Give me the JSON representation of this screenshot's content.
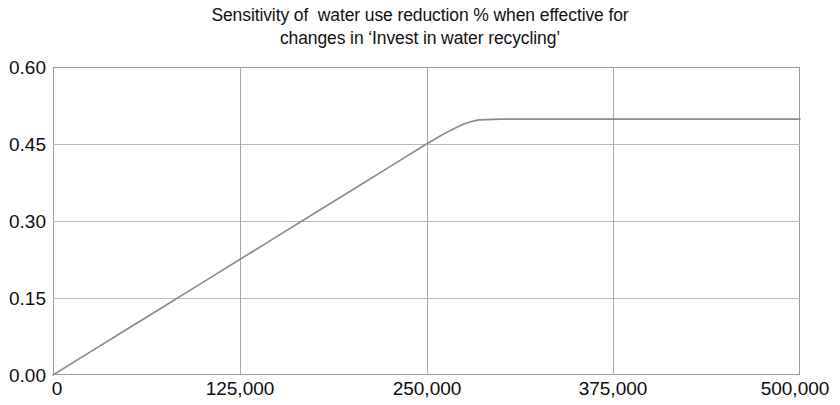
{
  "chart_data": {
    "type": "line",
    "title": "Sensitivity of  water use reduction % when effective for\nchanges in ‘Invest in water recycling’",
    "title_line1": "Sensitivity of  water use reduction % when effective for",
    "title_line2": "changes in ‘Invest in water recycling’",
    "xlabel": "",
    "ylabel": "",
    "xlim": [
      0,
      500000
    ],
    "ylim": [
      0.0,
      0.6
    ],
    "grid": true,
    "legend": "none",
    "line_color": "#8a8a8a",
    "frame_color": "#9a9a9a",
    "grid_color": "#b9b9b9",
    "xticks": [
      0,
      125000,
      250000,
      375000,
      500000
    ],
    "xtick_labels": [
      "0",
      "125,000",
      "250,000",
      "375,000",
      "500,000"
    ],
    "yticks": [
      0.0,
      0.15,
      0.3,
      0.45,
      0.6
    ],
    "ytick_labels": [
      "0.00",
      "0.15",
      "0.30",
      "0.45",
      "0.60"
    ],
    "series": [
      {
        "name": "water use reduction %",
        "x": [
          0,
          25000,
          50000,
          75000,
          100000,
          125000,
          150000,
          175000,
          200000,
          225000,
          250000,
          260000,
          265000,
          270000,
          275000,
          280000,
          285000,
          300000,
          325000,
          350000,
          375000,
          400000,
          425000,
          450000,
          475000,
          500000
        ],
        "values": [
          0.0,
          0.045,
          0.09,
          0.135,
          0.18,
          0.225,
          0.27,
          0.315,
          0.36,
          0.405,
          0.45,
          0.467,
          0.475,
          0.482,
          0.489,
          0.494,
          0.497,
          0.4985,
          0.4985,
          0.4985,
          0.4985,
          0.4985,
          0.4985,
          0.4985,
          0.4985,
          0.4985
        ]
      }
    ],
    "annotations": []
  }
}
